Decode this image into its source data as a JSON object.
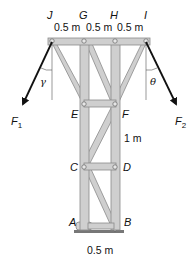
{
  "diagram": {
    "type": "truss",
    "joints": {
      "J": {
        "label": "J",
        "x": 51,
        "y": 41
      },
      "G": {
        "label": "G",
        "x": 84,
        "y": 41
      },
      "H": {
        "label": "H",
        "x": 115,
        "y": 41
      },
      "I": {
        "label": "I",
        "x": 147,
        "y": 41
      },
      "E": {
        "label": "E",
        "x": 85,
        "y": 104
      },
      "F": {
        "label": "F",
        "x": 115,
        "y": 104
      },
      "C": {
        "label": "C",
        "x": 85,
        "y": 167
      },
      "D": {
        "label": "D",
        "x": 115,
        "y": 167
      },
      "A": {
        "label": "A",
        "x": 85,
        "y": 228
      },
      "B": {
        "label": "B",
        "x": 115,
        "y": 228
      }
    },
    "dimensions": {
      "top_spacing_1": "0.5 m",
      "top_spacing_2": "0.5 m",
      "top_spacing_3": "0.5 m",
      "panel_height": "1 m",
      "base_width": "0.5 m"
    },
    "forces": {
      "F1": {
        "label": "F",
        "sub": "1"
      },
      "F2": {
        "label": "F",
        "sub": "2"
      }
    },
    "angles": {
      "gamma": "γ",
      "theta": "θ"
    },
    "colors": {
      "member_fill": "#c9c9c9",
      "member_stroke": "#8a8a8a",
      "force": "#111111"
    }
  }
}
